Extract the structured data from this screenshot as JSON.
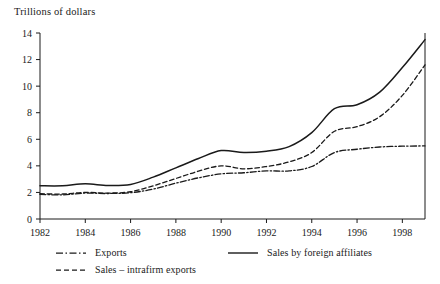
{
  "chart_data": {
    "type": "line",
    "title": "Trillions of dollars",
    "ylabel": "Trillions of dollars",
    "xlabel": "",
    "ylim": [
      0,
      14
    ],
    "xlim": [
      1982,
      1999
    ],
    "grid": false,
    "legend_position": "below-axes",
    "ytick_labels": [
      "0",
      "2",
      "4",
      "6",
      "8",
      "10",
      "12",
      "14"
    ],
    "ytick_values": [
      0,
      2,
      4,
      6,
      8,
      10,
      12,
      14
    ],
    "xtick_labels": [
      "1982",
      "1984",
      "1986",
      "1988",
      "1990",
      "1992",
      "1994",
      "1996",
      "1998"
    ],
    "xtick_values": [
      1982,
      1984,
      1986,
      1988,
      1990,
      1992,
      1994,
      1996,
      1998
    ],
    "x": [
      1982,
      1983,
      1984,
      1985,
      1986,
      1987,
      1988,
      1989,
      1990,
      1991,
      1992,
      1993,
      1994,
      1995,
      1996,
      1997,
      1998,
      1999
    ],
    "series": [
      {
        "name": "Sales by foreign affiliates",
        "style": "solid",
        "color": "#1a1a1a",
        "values": [
          2.5,
          2.5,
          2.65,
          2.52,
          2.6,
          3.15,
          3.85,
          4.55,
          5.15,
          5.0,
          5.1,
          5.45,
          6.5,
          8.3,
          8.6,
          9.55,
          11.4,
          13.5
        ]
      },
      {
        "name": "Sales – intrafirm exports",
        "style": "dashed",
        "color": "#1a1a1a",
        "values": [
          1.9,
          1.88,
          2.0,
          1.95,
          2.05,
          2.5,
          3.05,
          3.6,
          4.0,
          3.78,
          3.95,
          4.3,
          5.0,
          6.6,
          6.95,
          7.7,
          9.3,
          11.6
        ]
      },
      {
        "name": "Exports",
        "style": "dashdot",
        "color": "#1a1a1a",
        "values": [
          1.85,
          1.82,
          1.95,
          1.92,
          1.98,
          2.25,
          2.7,
          3.1,
          3.4,
          3.48,
          3.62,
          3.62,
          3.95,
          5.0,
          5.25,
          5.42,
          5.48,
          5.5
        ]
      }
    ],
    "legend": [
      {
        "label": "Exports",
        "style": "dashdot"
      },
      {
        "label": "Sales by foreign affiliates",
        "style": "solid"
      },
      {
        "label": "Sales – intrafirm exports",
        "style": "dashed"
      }
    ]
  }
}
